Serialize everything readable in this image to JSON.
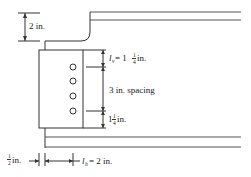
{
  "diagram": {
    "type": "beam-connection-detail",
    "dimensions": {
      "top_cope_depth": "2 in.",
      "lv_symbol": "l",
      "lv_subscript": "v",
      "lv_equals": " = 1",
      "lv_frac_num": "1",
      "lv_frac_den": "4",
      "lv_unit": " in.",
      "bolt_spacing": "3 in. spacing",
      "bottom_edge_whole": "1",
      "bottom_edge_frac_num": "1",
      "bottom_edge_frac_den": "4",
      "bottom_edge_unit": " in.",
      "gap_frac_num": "1",
      "gap_frac_den": "2",
      "gap_unit": " in.",
      "lh_symbol": "l",
      "lh_subscript": "h",
      "lh_value": " = 2 in."
    },
    "bolts": {
      "count": 4
    }
  }
}
